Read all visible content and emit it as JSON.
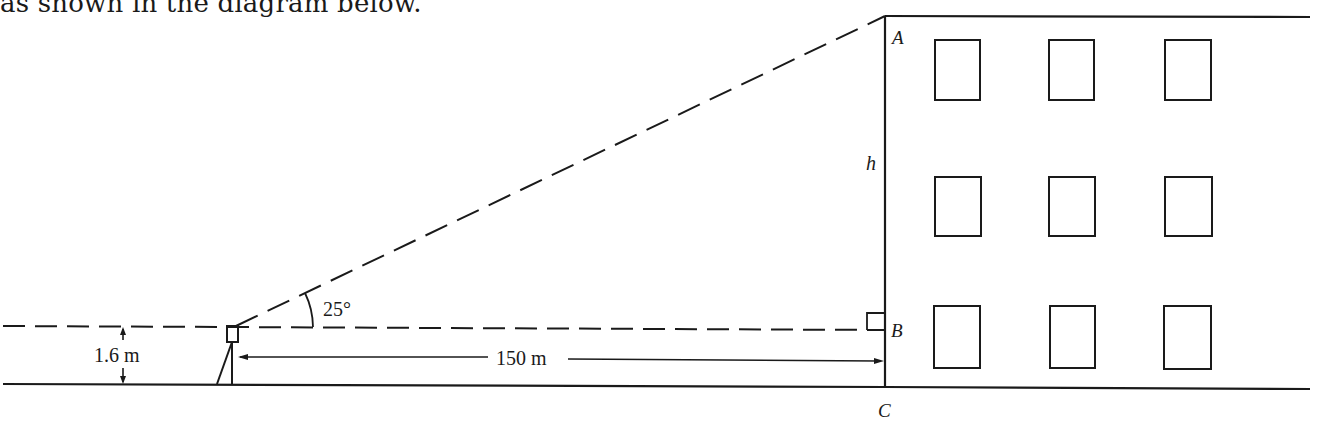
{
  "intro_text": "as shown in the diagram below.",
  "diagram": {
    "labels": {
      "top_point": "A",
      "bottom_point_eye_level": "B",
      "ground_point": "C",
      "height_var": "h",
      "angle": "25°",
      "instrument_height": "1.6 m",
      "horizontal_distance": "150 m"
    },
    "window_rows": 3,
    "window_cols": 3,
    "stroke_color": "#1a1a1a",
    "background_color": "#ffffff"
  }
}
